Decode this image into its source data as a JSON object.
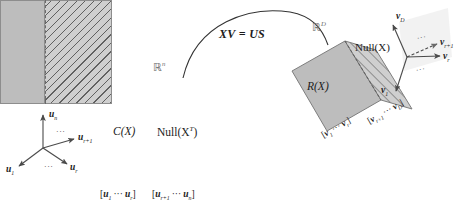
{
  "figure": {
    "equation": "XV = US",
    "left_space_label": "ℝ",
    "left_space_exp": "n",
    "right_space_label": "ℝ",
    "right_space_exp": "D"
  },
  "left_panel": {
    "column_space_label": "C(X)",
    "null_space_label": "Null(X",
    "null_space_sup": "T",
    "null_space_tail": ")",
    "basis_left": {
      "open": "[",
      "first": "u",
      "first_sub": "1",
      "dots": "···",
      "last": "u",
      "last_sub": "r",
      "close": "]"
    },
    "basis_right": {
      "open": "[",
      "first": "u",
      "first_sub": "r+1",
      "dots": "···",
      "last": "u",
      "last_sub": "n",
      "close": "]"
    },
    "axes": [
      {
        "name": "u",
        "sub": "n"
      },
      {
        "name": "u",
        "sub": "r+1"
      },
      {
        "name": "u",
        "sub": "1"
      },
      {
        "name": "u",
        "sub": "r"
      }
    ],
    "axes_dots_upper": "···",
    "axes_dots_lower": "···"
  },
  "right_panel": {
    "row_space_label": "R(X)",
    "null_space_label": "Null(X)",
    "basis_left": {
      "open": "[",
      "first": "v",
      "first_sub": "1",
      "dots": "···",
      "last": "v",
      "last_sub": "r",
      "close": "]"
    },
    "basis_right": {
      "open": "[",
      "first": "v",
      "first_sub": "r+1",
      "dots": "···",
      "last": "v",
      "last_sub": "D",
      "close": "]"
    },
    "axes": [
      {
        "name": "v",
        "sub": "D"
      },
      {
        "name": "v",
        "sub": "r+1"
      },
      {
        "name": "v",
        "sub": "r"
      },
      {
        "name": "v",
        "sub": "1"
      }
    ],
    "axes_dots_upper": "···",
    "axes_dots_lower": "···"
  },
  "colors": {
    "fill_solid": "#bdbdbd",
    "fill_hatched": "#cfcfcf",
    "stroke": "#8d8d8d",
    "text": "#1c1c1c"
  }
}
